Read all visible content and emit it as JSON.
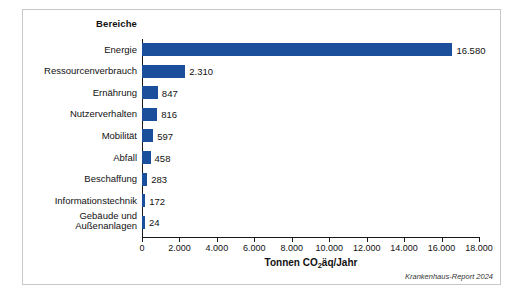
{
  "card": {
    "category_header": "Bereiche",
    "source_note": "Krankenhaus-Report 2024"
  },
  "chart_data": {
    "type": "bar",
    "orientation": "horizontal",
    "title": "",
    "xlabel": "Tonnen CO₂äq/Jahr",
    "ylabel": "Bereiche",
    "xlim": [
      0,
      18000
    ],
    "grid": false,
    "bar_color": "#1b4f9c",
    "categories": [
      "Energie",
      "Ressourcenverbrauch",
      "Ernährung",
      "Nutzerverhalten",
      "Mobilität",
      "Abfall",
      "Beschaffung",
      "Informationstechnik",
      "Gebäude und\nAußenanlagen"
    ],
    "category_labels": [
      "Energie",
      "Ressourcenverbrauch",
      "Ernährung",
      "Nutzerverhalten",
      "Mobilität",
      "Abfall",
      "Beschaffung",
      "Informationstechnik",
      "Gebäude und"
    ],
    "category_labels_line2": [
      "",
      "",
      "",
      "",
      "",
      "",
      "",
      "",
      "Außenanlagen"
    ],
    "values": [
      16580,
      2310,
      847,
      816,
      597,
      458,
      283,
      172,
      24
    ],
    "value_labels": [
      "16.580",
      "2.310",
      "847",
      "816",
      "597",
      "458",
      "283",
      "172",
      "24"
    ],
    "xticks": [
      0,
      2000,
      4000,
      6000,
      8000,
      10000,
      12000,
      14000,
      16000,
      18000
    ],
    "xtick_labels": [
      "0",
      "2.000",
      "4.000",
      "6.000",
      "8.000",
      "10.000",
      "12.000",
      "14.000",
      "16.000",
      "18.000"
    ]
  }
}
